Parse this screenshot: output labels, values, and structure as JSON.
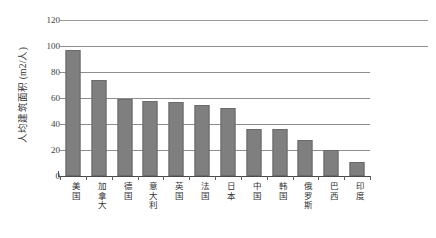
{
  "chart_data": {
    "type": "bar",
    "title": "",
    "subtitle": "",
    "xlabel": "",
    "ylabel": "人均建筑面积（m²/人）",
    "ylabel_display": "人均建筑面积 (m2/人)",
    "ylim": [
      0,
      120
    ],
    "ytick_values": [
      0,
      20,
      40,
      60,
      80,
      100,
      120
    ],
    "ytick_labels": [
      "0",
      "20",
      "40",
      "60",
      "80",
      "100",
      "120"
    ],
    "grid": "horizontal",
    "legend": "none",
    "bar_color": "#7f7f7f",
    "gridline_color": "#8d8d8d",
    "axis_color": "#4a4a4a",
    "categories": [
      "美国",
      "加拿大",
      "德国",
      "意大利",
      "英国",
      "法国",
      "日本",
      "中国",
      "韩国",
      "俄罗斯",
      "巴西",
      "印度"
    ],
    "values": [
      97,
      74,
      59,
      57.5,
      57,
      55,
      52,
      36.5,
      36,
      28,
      20,
      11
    ],
    "series": [
      {
        "name": "人均建筑面积",
        "values": [
          97,
          74,
          59,
          57.5,
          57,
          55,
          52,
          36.5,
          36,
          28,
          20,
          11
        ]
      }
    ]
  },
  "units": {
    "area": "m2",
    "per": "人"
  }
}
